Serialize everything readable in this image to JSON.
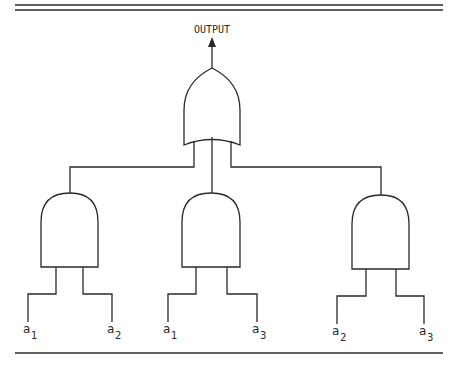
{
  "diagram": {
    "output_label": "OUTPUT",
    "or_gate": {
      "type": "OR",
      "inputs": 3
    },
    "and_gates": [
      {
        "type": "AND",
        "inputs": [
          {
            "base": "a",
            "sub": "1"
          },
          {
            "base": "a",
            "sub": "2"
          }
        ]
      },
      {
        "type": "AND",
        "inputs": [
          {
            "base": "a",
            "sub": "1"
          },
          {
            "base": "a",
            "sub": "3"
          }
        ]
      },
      {
        "type": "AND",
        "inputs": [
          {
            "base": "a",
            "sub": "2"
          },
          {
            "base": "a",
            "sub": "3"
          }
        ]
      }
    ]
  }
}
